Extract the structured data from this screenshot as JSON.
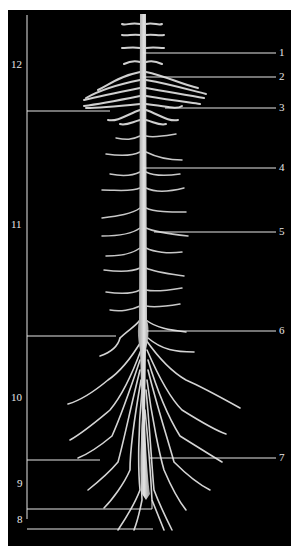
{
  "figure": {
    "background": "#000000",
    "page_background": "#ffffff",
    "nerve_color": "#d9d9d9",
    "line_color": "#e6e6e6"
  },
  "right_labels": [
    {
      "id": "1",
      "text": "1",
      "y": 53,
      "target_x": 143
    },
    {
      "id": "2",
      "text": "2",
      "y": 77,
      "target_x": 143
    },
    {
      "id": "3",
      "text": "3",
      "y": 108,
      "target_x": 165
    },
    {
      "id": "4",
      "text": "4",
      "y": 168,
      "target_x": 143
    },
    {
      "id": "5",
      "text": "5",
      "y": 232,
      "target_x": 154
    },
    {
      "id": "6",
      "text": "6",
      "y": 331,
      "target_x": 147
    },
    {
      "id": "7",
      "text": "7",
      "y": 458,
      "target_x": 150
    }
  ],
  "left_labels": [
    {
      "id": "12",
      "text": "12",
      "y": 65
    },
    {
      "id": "11",
      "text": "11",
      "y": 225
    },
    {
      "id": "10",
      "text": "10",
      "y": 398
    },
    {
      "id": "9",
      "text": "9",
      "y": 484
    },
    {
      "id": "8",
      "text": "8",
      "y": 520
    }
  ]
}
